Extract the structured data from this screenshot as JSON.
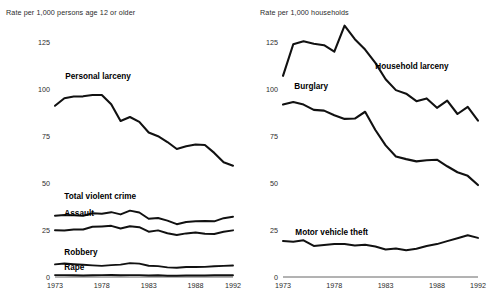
{
  "figure": {
    "background_color": "#ffffff",
    "line_color": "#111111",
    "text_color": "#2b2b2b"
  },
  "panels": {
    "left": {
      "axis_title": "Rate per 1,000 persons age 12 or older",
      "y_ticks": [
        "125",
        "100",
        "75",
        "50",
        "25",
        "0"
      ],
      "x_ticks": [
        "1973",
        "1978",
        "1983",
        "1988",
        "1992"
      ],
      "series_labels": [
        "Personal larceny",
        "Total violent crime",
        "Assault",
        "Robbery",
        "Rape"
      ]
    },
    "right": {
      "axis_title": "Rate per 1,000 households",
      "y_ticks": [
        "125",
        "100",
        "75",
        "50",
        "25",
        "0"
      ],
      "x_ticks": [
        "1973",
        "1978",
        "1983",
        "1988",
        "1992"
      ],
      "series_labels": [
        "Household larceny",
        "Burglary",
        "Motor vehicle theft"
      ]
    }
  },
  "chart_data": [
    {
      "type": "line",
      "title": "",
      "xlabel": "",
      "ylabel": "Rate per 1,000 persons age 12 or older",
      "xlim": [
        1973,
        1992
      ],
      "ylim": [
        0,
        125
      ],
      "yticks": [
        0,
        25,
        50,
        75,
        100,
        125
      ],
      "xticks": [
        1973,
        1978,
        1983,
        1988,
        1992
      ],
      "grid": false,
      "legend": "inline-annotations",
      "x": [
        1973,
        1974,
        1975,
        1976,
        1977,
        1978,
        1979,
        1980,
        1981,
        1982,
        1983,
        1984,
        1985,
        1986,
        1987,
        1988,
        1989,
        1990,
        1991,
        1992
      ],
      "series": [
        {
          "name": "Personal larceny",
          "values": [
            91.1,
            95.1,
            96.0,
            96.1,
            96.8,
            96.8,
            91.9,
            83.0,
            85.1,
            82.5,
            76.9,
            74.9,
            71.8,
            68.1,
            69.5,
            70.5,
            70.2,
            66.0,
            61.0,
            59.2
          ]
        },
        {
          "name": "Total violent crime",
          "values": [
            32.6,
            33.0,
            32.8,
            32.6,
            33.9,
            33.7,
            34.5,
            33.3,
            35.3,
            34.3,
            31.0,
            31.4,
            30.0,
            28.1,
            29.3,
            29.6,
            29.8,
            29.6,
            31.3,
            32.1
          ]
        },
        {
          "name": "Assault",
          "values": [
            24.9,
            24.8,
            25.2,
            25.3,
            26.7,
            26.9,
            27.2,
            25.8,
            27.0,
            26.5,
            24.1,
            24.8,
            23.3,
            22.3,
            23.2,
            23.7,
            23.0,
            22.9,
            24.1,
            24.8
          ]
        },
        {
          "name": "Robbery",
          "values": [
            6.7,
            7.2,
            6.8,
            6.5,
            6.2,
            5.9,
            6.3,
            6.6,
            7.4,
            7.1,
            6.0,
            5.8,
            5.1,
            4.9,
            5.3,
            5.3,
            5.4,
            5.7,
            5.9,
            6.1
          ]
        },
        {
          "name": "Rape",
          "values": [
            1.0,
            1.0,
            0.9,
            0.8,
            0.9,
            1.0,
            1.1,
            0.9,
            1.0,
            1.0,
            0.8,
            0.9,
            0.7,
            0.7,
            0.8,
            0.8,
            0.8,
            0.9,
            0.9,
            0.9
          ]
        }
      ]
    },
    {
      "type": "line",
      "title": "",
      "xlabel": "",
      "ylabel": "Rate per 1,000 households",
      "xlim": [
        1973,
        1992
      ],
      "ylim": [
        0,
        125
      ],
      "yticks": [
        0,
        25,
        50,
        75,
        100,
        125
      ],
      "xticks": [
        1973,
        1978,
        1983,
        1988,
        1992
      ],
      "grid": false,
      "legend": "inline-annotations",
      "x": [
        1973,
        1974,
        1975,
        1976,
        1977,
        1978,
        1979,
        1980,
        1981,
        1982,
        1983,
        1984,
        1985,
        1986,
        1987,
        1988,
        1989,
        1990,
        1991,
        1992
      ],
      "series": [
        {
          "name": "Household larceny",
          "values": [
            107.0,
            123.8,
            125.4,
            124.1,
            123.3,
            119.9,
            133.7,
            126.5,
            121.0,
            113.9,
            105.2,
            99.4,
            97.5,
            93.5,
            95.0,
            90.0,
            93.8,
            86.7,
            90.5,
            83.2
          ]
        },
        {
          "name": "Burglary",
          "values": [
            91.7,
            93.1,
            91.7,
            88.9,
            88.5,
            86.0,
            84.1,
            84.3,
            87.9,
            78.2,
            70.0,
            64.1,
            62.7,
            61.5,
            62.1,
            62.4,
            58.9,
            55.7,
            53.8,
            48.9
          ]
        },
        {
          "name": "Motor vehicle theft",
          "values": [
            19.1,
            18.8,
            19.5,
            16.5,
            17.0,
            17.5,
            17.5,
            16.7,
            17.1,
            16.2,
            14.6,
            15.2,
            14.2,
            15.0,
            16.5,
            17.5,
            19.1,
            20.6,
            22.2,
            20.8
          ]
        }
      ]
    }
  ],
  "annotations": {
    "left": [
      {
        "label": "Personal larceny",
        "x": 1974.1,
        "y": 106.0
      },
      {
        "label": "Total violent crime",
        "x": 1974.0,
        "y": 42.0
      },
      {
        "label": "Assault",
        "x": 1974.0,
        "y": 33.0
      },
      {
        "label": "Robbery",
        "x": 1974.0,
        "y": 12.0
      },
      {
        "label": "Rape",
        "x": 1974.0,
        "y": 4.5
      }
    ],
    "right": [
      {
        "label": "Household larceny",
        "x": 1982.0,
        "y": 111.0
      },
      {
        "label": "Burglary",
        "x": 1974.1,
        "y": 100.5
      },
      {
        "label": "Motor vehicle theft",
        "x": 1974.2,
        "y": 23.0
      }
    ]
  }
}
